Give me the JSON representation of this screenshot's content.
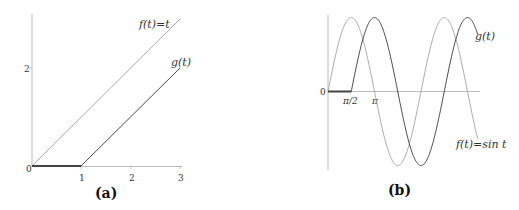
{
  "chart_data": [
    {
      "type": "line",
      "caption": "(a)",
      "xlabel": "",
      "ylabel": "",
      "x_ticks": [
        "0",
        "1",
        "2",
        "3"
      ],
      "y_ticks": [
        "2"
      ],
      "xlim": [
        0,
        3
      ],
      "ylim": [
        0,
        3
      ],
      "grid": false,
      "series": [
        {
          "name": "f(t)=t",
          "x": [
            0,
            3
          ],
          "values": [
            0,
            3
          ],
          "color": "#999999"
        },
        {
          "name": "g(t)",
          "x": [
            0,
            1,
            3
          ],
          "values": [
            0,
            0,
            2
          ],
          "color": "#333333"
        }
      ],
      "annotations": [
        "f(t)=t",
        "g(t)"
      ]
    },
    {
      "type": "line",
      "caption": "(b)",
      "xlabel": "",
      "ylabel": "",
      "x_ticks": [
        "0",
        "π/2",
        "π"
      ],
      "xlim": [
        0,
        "3.2π"
      ],
      "ylim": [
        -1,
        1
      ],
      "grid": false,
      "series": [
        {
          "name": "f(t)=sin t",
          "formula": "sin(t)",
          "color": "#999999"
        },
        {
          "name": "g(t)",
          "formula": "0 for t<π/2; sin(t-π/2) for t≥π/2",
          "color": "#333333"
        }
      ],
      "annotations": [
        "g(t)",
        "f(t)=sin t"
      ]
    }
  ],
  "panel_a": {
    "caption": "(a)",
    "ticks": {
      "x0": "0",
      "x1": "1",
      "x2": "2",
      "x3": "3",
      "y2": "2"
    },
    "labels": {
      "f": "f(t)=t",
      "g": "g(t)"
    }
  },
  "panel_b": {
    "caption": "(b)",
    "ticks": {
      "x0": "0",
      "xhalfpi": "π/2",
      "xpi": "π"
    },
    "labels": {
      "f": "f(t)=sin t",
      "g": "g(t)"
    }
  }
}
